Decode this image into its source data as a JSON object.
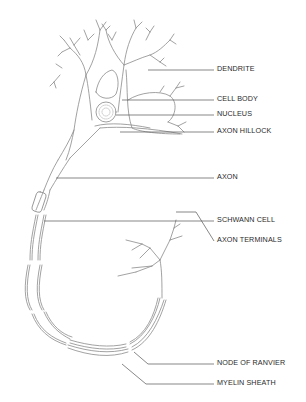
{
  "diagram": {
    "line_color": "#6a6a6a",
    "text_color": "#2a2a2a",
    "labels": [
      {
        "id": "dendrite",
        "text": "DENDRITE",
        "y": 68
      },
      {
        "id": "cell-body",
        "text": "CELL BODY",
        "y": 98
      },
      {
        "id": "nucleus",
        "text": "NUCLEUS",
        "y": 113
      },
      {
        "id": "axon-hillock",
        "text": "AXON HILLOCK",
        "y": 130
      },
      {
        "id": "axon",
        "text": "AXON",
        "y": 176
      },
      {
        "id": "schwann-cell",
        "text": "SCHWANN CELL",
        "y": 219
      },
      {
        "id": "axon-terminals",
        "text": "AXON TERMINALS",
        "y": 239
      },
      {
        "id": "node-of-ranvier",
        "text": "NODE OF RANVIER",
        "y": 362
      },
      {
        "id": "myelin-sheath",
        "text": "MYELIN SHEATH",
        "y": 382
      }
    ]
  }
}
